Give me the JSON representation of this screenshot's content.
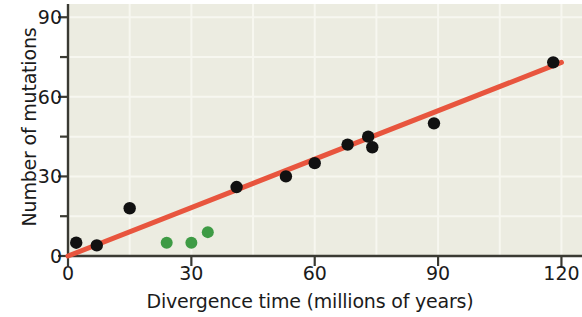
{
  "chart_data": {
    "type": "scatter",
    "title": "",
    "xlabel": "Divergence time (millions of years)",
    "ylabel": "Number of mutations",
    "xlim": [
      0,
      125
    ],
    "ylim": [
      0,
      95
    ],
    "x_major_ticks": [
      0,
      30,
      60,
      90,
      120
    ],
    "x_minor_ticks": [
      15,
      45,
      75,
      105
    ],
    "y_major_ticks": [
      0,
      30,
      60,
      90
    ],
    "y_minor_ticks": [
      15,
      45,
      75
    ],
    "grid": "faint horizontal and vertical gridlines on plot background",
    "legend": "none",
    "plot_background_color": "#ecece1",
    "series": [
      {
        "name": "primary-data-points",
        "marker": "filled circle",
        "color": "#111111",
        "points": [
          {
            "x": 2,
            "y": 5
          },
          {
            "x": 7,
            "y": 4
          },
          {
            "x": 15,
            "y": 18
          },
          {
            "x": 41,
            "y": 26
          },
          {
            "x": 53,
            "y": 30
          },
          {
            "x": 60,
            "y": 35
          },
          {
            "x": 68,
            "y": 42
          },
          {
            "x": 73,
            "y": 45
          },
          {
            "x": 74,
            "y": 41
          },
          {
            "x": 89,
            "y": 50
          },
          {
            "x": 118,
            "y": 73
          }
        ]
      },
      {
        "name": "highlighted-data-points",
        "marker": "filled circle",
        "color": "#3e9b45",
        "points": [
          {
            "x": 24,
            "y": 5
          },
          {
            "x": 30,
            "y": 5
          },
          {
            "x": 34,
            "y": 9
          }
        ]
      }
    ],
    "trendline": {
      "name": "best-fit-line",
      "color": "#e8553e",
      "x0": 0,
      "y0": 0,
      "x1": 120,
      "y1": 73,
      "width_px": 5
    }
  },
  "axes": {
    "x_tick_labels": [
      "0",
      "30",
      "60",
      "90",
      "120"
    ],
    "y_tick_labels": [
      "0",
      "30",
      "60",
      "90"
    ],
    "x_title": "Divergence time (millions of years)",
    "y_title": "Number of mutations"
  }
}
